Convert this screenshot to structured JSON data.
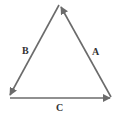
{
  "diagram": {
    "type": "vector-triangle",
    "stroke_color": "#6b6b6b",
    "vertices": {
      "top": [
        60,
        5
      ],
      "bottom_left": [
        9,
        97
      ],
      "bottom_right": [
        111,
        97
      ]
    },
    "vectors": [
      {
        "label": "A",
        "from": "bottom_right",
        "to": "top"
      },
      {
        "label": "B",
        "from": "top",
        "to": "bottom_left"
      },
      {
        "label": "C",
        "from": "bottom_left",
        "to": "bottom_right"
      }
    ]
  },
  "labels": {
    "a": "A",
    "b": "B",
    "c": "C"
  }
}
